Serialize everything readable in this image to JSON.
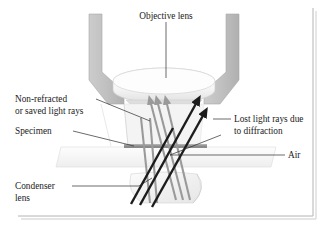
{
  "figure": {
    "title": "Objective lens",
    "background_color": "#ffffff",
    "frame_color": "#b4b4b4"
  },
  "labels": {
    "objective_lens": "Objective lens",
    "non_refracted_line1": "Non-refracted",
    "non_refracted_line2": "or saved light rays",
    "specimen": "Specimen",
    "lost_light_line1": "Lost light rays due",
    "lost_light_line2": "to diffraction",
    "air": "Air",
    "condenser_line1": "Condenser",
    "condenser_line2": "lens"
  },
  "colors": {
    "housing_gray": "#c3c3c3",
    "housing_gray_dark": "#aeaeae",
    "lens_white": "#fbfbfb",
    "lens_shade": "#e4e4e4",
    "saved_ray": "#9a9a9a",
    "lost_ray": "#1c1c1c",
    "specimen_strip": "#8a8a8a",
    "slide_white": "#f6f6f6",
    "label_text": "#1a1a1a",
    "leader_line": "#2b2b2b"
  },
  "elements": {
    "objective_housing": "objective-housing",
    "objective_lens_body": "objective-lens",
    "specimen_slide": "specimen-slide",
    "specimen_strip": "specimen-strip",
    "condenser_lens_body": "condenser-lens",
    "saved_rays": "saved-light-rays",
    "lost_rays": "lost-light-rays",
    "air_gap": "air-gap"
  }
}
